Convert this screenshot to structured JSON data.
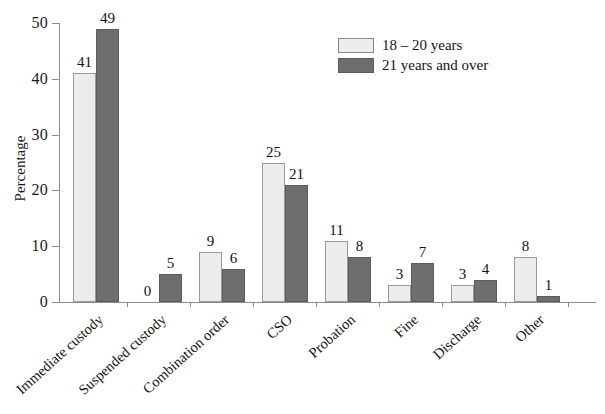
{
  "chart_data": {
    "type": "bar",
    "title": "",
    "subtitle": "",
    "xlabel": "",
    "ylabel": "Percentage",
    "ylim": [
      0,
      50
    ],
    "yticks": [
      0,
      10,
      20,
      30,
      40,
      50
    ],
    "grid": false,
    "legend_position": "top-center",
    "categories": [
      "Immediate custody",
      "Suspended custody",
      "Combination order",
      "CSO",
      "Probation",
      "Fine",
      "Discharge",
      "Other"
    ],
    "series": [
      {
        "name": "18 – 20 years",
        "color": "#ececea",
        "values": [
          41,
          0,
          9,
          25,
          11,
          3,
          3,
          8
        ]
      },
      {
        "name": "21 years and over",
        "color": "#6e6e6e",
        "values": [
          49,
          5,
          6,
          21,
          8,
          7,
          4,
          1
        ]
      }
    ],
    "data_labels": [
      [
        "41",
        "49"
      ],
      [
        "0",
        "5"
      ],
      [
        "9",
        "6"
      ],
      [
        "25",
        "21"
      ],
      [
        "11",
        "8"
      ],
      [
        "3",
        "7"
      ],
      [
        "3",
        "4"
      ],
      [
        "8",
        "1"
      ]
    ]
  },
  "legend": {
    "items": [
      {
        "label": "18 – 20 years"
      },
      {
        "label": "21 years and over"
      }
    ]
  },
  "axis": {
    "y_title": "Percentage",
    "y_ticks": [
      "0",
      "10",
      "20",
      "30",
      "40",
      "50"
    ]
  }
}
